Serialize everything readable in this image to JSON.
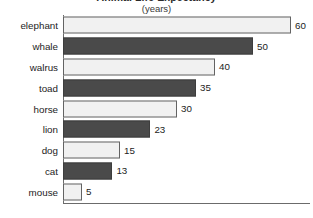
{
  "chart_data": {
    "type": "bar",
    "orientation": "horizontal",
    "title": "Animal Life Expectancy",
    "subtitle": "(years)",
    "xlabel": "",
    "ylabel": "",
    "xlim": [
      0,
      60
    ],
    "grid": false,
    "legend": "none",
    "categories": [
      "elephant",
      "whale",
      "walrus",
      "toad",
      "horse",
      "lion",
      "dog",
      "cat",
      "mouse"
    ],
    "values": [
      60,
      50,
      40,
      35,
      30,
      23,
      15,
      13,
      5
    ],
    "value_labels": [
      "60",
      "50",
      "40",
      "35",
      "30",
      "23",
      "15",
      "13",
      "5"
    ],
    "bar_styles": [
      "light",
      "dark",
      "light",
      "dark",
      "light",
      "dark",
      "light",
      "dark",
      "light"
    ],
    "colors": {
      "bar_light": "#f1f1f1",
      "bar_dark": "#4a4a4a",
      "bar_outline": "#5c5c5c",
      "text": "#1c1c1c",
      "axis": "#6b6b6b",
      "background": "#ffffff"
    },
    "rows": [
      {
        "category": "elephant",
        "value": 60,
        "label": "60",
        "style": "light"
      },
      {
        "category": "whale",
        "value": 50,
        "label": "50",
        "style": "dark"
      },
      {
        "category": "walrus",
        "value": 40,
        "label": "40",
        "style": "light"
      },
      {
        "category": "toad",
        "value": 35,
        "label": "35",
        "style": "dark"
      },
      {
        "category": "horse",
        "value": 30,
        "label": "30",
        "style": "light"
      },
      {
        "category": "lion",
        "value": 23,
        "label": "23",
        "style": "dark"
      },
      {
        "category": "dog",
        "value": 15,
        "label": "15",
        "style": "light"
      },
      {
        "category": "cat",
        "value": 13,
        "label": "13",
        "style": "dark"
      },
      {
        "category": "mouse",
        "value": 5,
        "label": "5",
        "style": "light"
      }
    ]
  }
}
